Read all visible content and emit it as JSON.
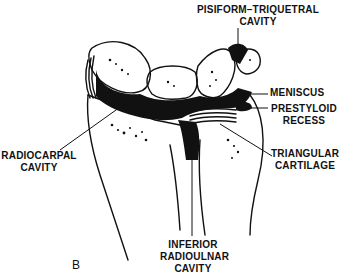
{
  "figure": {
    "panel_letter": "B",
    "colors": {
      "ink": "#111111",
      "background": "#ffffff",
      "cavity_fill": "#111111"
    }
  },
  "labels": {
    "pisiform_triquetral": {
      "line1": "PISIFORM–TRIQUETRAL",
      "line2": "CAVITY"
    },
    "meniscus": {
      "line1": "MENISCUS"
    },
    "prestyloid": {
      "line1": "PRESTYLOID",
      "line2": "RECESS"
    },
    "radiocarpal": {
      "line1": "RADIOCARPAL",
      "line2": "CAVITY"
    },
    "triangular": {
      "line1": "TRIANGULAR",
      "line2": "CARTILAGE"
    },
    "inferior_radioulnar": {
      "line1": "INFERIOR",
      "line2": "RADIOULNAR",
      "line3": "CAVITY"
    }
  }
}
